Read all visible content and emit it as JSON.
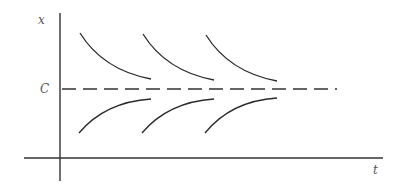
{
  "diagram": {
    "type": "solution-curves-equilibrium",
    "axes": {
      "x_label": "t",
      "y_label": "x",
      "origin": [
        60,
        158
      ],
      "x_axis": {
        "from": 24,
        "to": 383,
        "y": 158
      },
      "y_axis": {
        "x": 60,
        "from": 13,
        "to": 181
      }
    },
    "equilibrium": {
      "label": "C",
      "y": 89,
      "x_from": 62,
      "x_to": 337,
      "style": "dashed"
    },
    "curves_above": [
      {
        "start": [
          80,
          33
        ],
        "end": [
          151,
          79
        ]
      },
      {
        "start": [
          143,
          34
        ],
        "end": [
          214,
          80
        ]
      },
      {
        "start": [
          206,
          35
        ],
        "end": [
          277,
          81
        ]
      }
    ],
    "curves_below": [
      {
        "start": [
          79,
          133
        ],
        "end": [
          151,
          99
        ]
      },
      {
        "start": [
          142,
          133
        ],
        "end": [
          214,
          99
        ]
      },
      {
        "start": [
          205,
          133
        ],
        "end": [
          277,
          98
        ]
      }
    ],
    "colors": {
      "line": "#2a2a2a",
      "label": "#555555",
      "background": "#ffffff"
    }
  }
}
